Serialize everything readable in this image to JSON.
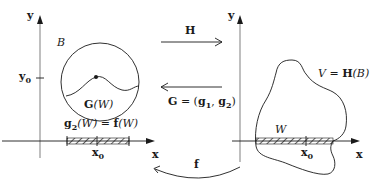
{
  "diagram": {
    "left_panel": {
      "y_axis_label": "y",
      "x_axis_label": "x",
      "y_tick_label": "y",
      "y_tick_sub": "0",
      "x_tick_label": "x",
      "x_tick_sub": "0",
      "region_label": "B",
      "curve_label_bold": "G",
      "curve_label_arg": "(W)",
      "segment_label_left_bold": "g",
      "segment_label_left_sub": "2",
      "segment_label_left_arg": "(W) = ",
      "segment_label_right_bold": "f",
      "segment_label_right_arg": "(W)"
    },
    "right_panel": {
      "y_axis_label": "y",
      "x_axis_label": "x",
      "x_tick_label": "x",
      "x_tick_sub": "0",
      "region_label_var": "V",
      "region_label_eq": " = ",
      "region_label_bold": "H",
      "region_label_arg": "(B)",
      "segment_label": "W"
    },
    "maps": {
      "H_label": "H",
      "G_label_bold": "G",
      "G_label_eq": " = (",
      "G_g1_bold": "g",
      "G_g1_sub": "1",
      "G_sep": ", ",
      "G_g2_bold": "g",
      "G_g2_sub": "2",
      "G_close": ")",
      "f_label": "f"
    },
    "colors": {
      "line": "#1a1a1a",
      "axis": "#8a8a8a",
      "background": "#ffffff"
    }
  }
}
